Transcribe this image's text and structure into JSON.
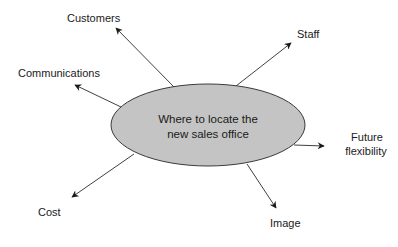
{
  "diagram": {
    "type": "mind-map",
    "center": {
      "line1": "Where to locate the",
      "line2": "new sales office",
      "fill": "#c4c4c4",
      "stroke": "#3a3a3a"
    },
    "branches": [
      {
        "id": "customers",
        "label": "Customers"
      },
      {
        "id": "communications",
        "label": "Communications"
      },
      {
        "id": "staff",
        "label": "Staff"
      },
      {
        "id": "future-flexibility",
        "label_line1": "Future",
        "label_line2": "flexibility"
      },
      {
        "id": "image",
        "label": "Image"
      },
      {
        "id": "cost",
        "label": "Cost"
      }
    ],
    "arrow_color": "#2a2a2a"
  }
}
